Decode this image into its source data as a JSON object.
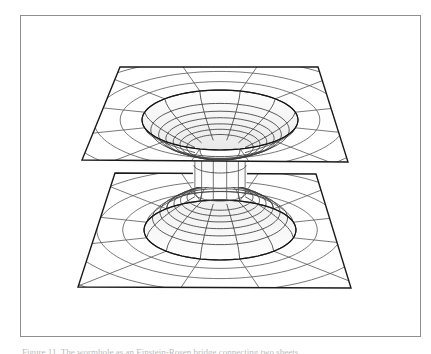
{
  "figure": {
    "caption": "Figure 11. The wormhole as an Einstein-Rosen bridge connecting two sheets.",
    "frame": {
      "border_color": "#8e8e8e",
      "background_color": "#ffffff",
      "x": 20,
      "y": 15,
      "width": 401,
      "height": 322
    },
    "ink_color": "#1a1a1a",
    "grid_color": "#4a4a4a",
    "fill_color": "#fcfcfc",
    "shade_color": "#eeeeee"
  },
  "chart_data": {
    "type": "diagram",
    "subtitle": "Two asymptotically flat sheets joined by a throat",
    "xlabel": "",
    "ylabel": "",
    "projection": "oblique-parallel",
    "grid": true,
    "legend": null,
    "annotations": [],
    "elements": [
      {
        "name": "upper-sheet",
        "kind": "plane-with-funnel",
        "corners": [
          [
            100,
            52
          ],
          [
            298,
            52
          ],
          [
            328,
            147
          ],
          [
            62,
            145
          ]
        ],
        "funnel_center": [
          200,
          105
        ],
        "mouth_rx": 78,
        "mouth_ry": 30,
        "throat_rx": 26,
        "throat_ry": 8,
        "depth": 30
      },
      {
        "name": "lower-sheet",
        "kind": "plane-with-funnel",
        "corners": [
          [
            95,
            158
          ],
          [
            296,
            159
          ],
          [
            331,
            273
          ],
          [
            58,
            272
          ]
        ],
        "funnel_center": [
          200,
          215
        ],
        "mouth_rx": 76,
        "mouth_ry": 30,
        "throat_rx": 26,
        "throat_ry": 8,
        "depth": -36
      },
      {
        "name": "throat-tube",
        "kind": "tube",
        "top_center": [
          200,
          135
        ],
        "bottom_center": [
          200,
          180
        ],
        "radius": 26
      }
    ],
    "grid_spec": {
      "radial_lines": 12,
      "concentric_rings": 7,
      "ring_radii_ratio": [
        0.14,
        0.27,
        0.4,
        0.54,
        0.68,
        0.83,
        1.0
      ]
    }
  }
}
